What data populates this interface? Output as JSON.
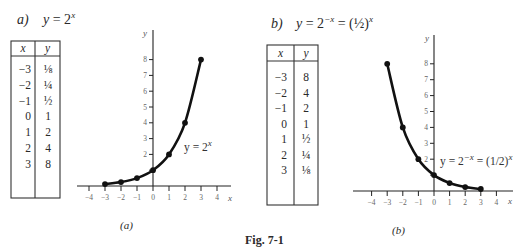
{
  "figure": {
    "caption": "Fig. 7-1"
  },
  "panels": [
    {
      "label": "a)",
      "equation": {
        "lhs": "y",
        "eq": " = 2",
        "sup1": "x",
        "rest": "",
        "sup2": ""
      },
      "table": {
        "headers": [
          "x",
          "y"
        ],
        "rows": [
          [
            "−3",
            "⅛"
          ],
          [
            "−2",
            "¼"
          ],
          [
            "−1",
            "½"
          ],
          [
            "0",
            "1"
          ],
          [
            "1",
            "2"
          ],
          [
            "2",
            "4"
          ],
          [
            "3",
            "8"
          ]
        ]
      },
      "curve_label": {
        "lhs": "y = 2",
        "sup1": "x",
        "rest": "",
        "sup2": ""
      },
      "sub_caption": "(a)"
    },
    {
      "label": "b)",
      "equation": {
        "lhs": "y",
        "eq": " = 2",
        "sup1": "−x",
        "rest": " = (½)",
        "sup2": "x"
      },
      "table": {
        "headers": [
          "x",
          "y"
        ],
        "rows": [
          [
            "−3",
            "8"
          ],
          [
            "−2",
            "4"
          ],
          [
            "−1",
            "2"
          ],
          [
            "0",
            "1"
          ],
          [
            "1",
            "½"
          ],
          [
            "2",
            "¼"
          ],
          [
            "3",
            "⅛"
          ]
        ]
      },
      "curve_label": {
        "lhs": "y = 2",
        "sup1": "−x",
        "rest": " = (1/2)",
        "sup2": "x"
      },
      "sub_caption": "(b)"
    }
  ],
  "chart_data": [
    {
      "type": "line",
      "title": "y = 2^x",
      "xlabel": "x",
      "ylabel": "y",
      "x": [
        -3,
        -2,
        -1,
        0,
        1,
        2,
        3
      ],
      "values": [
        0.125,
        0.25,
        0.5,
        1,
        2,
        4,
        8
      ],
      "xlim": [
        -4,
        4
      ],
      "ylim": [
        0,
        8
      ],
      "x_ticks": [
        -4,
        -3,
        -2,
        -1,
        0,
        1,
        2,
        3,
        4
      ],
      "y_ticks": [
        1,
        2,
        3,
        4,
        5,
        6,
        7,
        8
      ],
      "y_tick_labels": [
        2,
        3,
        4,
        5,
        6,
        7,
        8
      ],
      "annotation": "y = 2^x",
      "grid": false,
      "legend": null
    },
    {
      "type": "line",
      "title": "y = 2^-x = (1/2)^x",
      "xlabel": "x",
      "ylabel": "y",
      "x": [
        -3,
        -2,
        -1,
        0,
        1,
        2,
        3
      ],
      "values": [
        8,
        4,
        2,
        1,
        0.5,
        0.25,
        0.125
      ],
      "xlim": [
        -4,
        4
      ],
      "ylim": [
        0,
        8
      ],
      "x_ticks": [
        -4,
        -3,
        -2,
        -1,
        0,
        1,
        2,
        3,
        4
      ],
      "y_ticks": [
        1,
        2,
        3,
        4,
        5,
        6,
        7,
        8
      ],
      "y_tick_labels": [
        2,
        3,
        4,
        5,
        6,
        7,
        8
      ],
      "annotation": "y = 2^-x = (1/2)^x",
      "grid": false,
      "legend": null
    }
  ]
}
